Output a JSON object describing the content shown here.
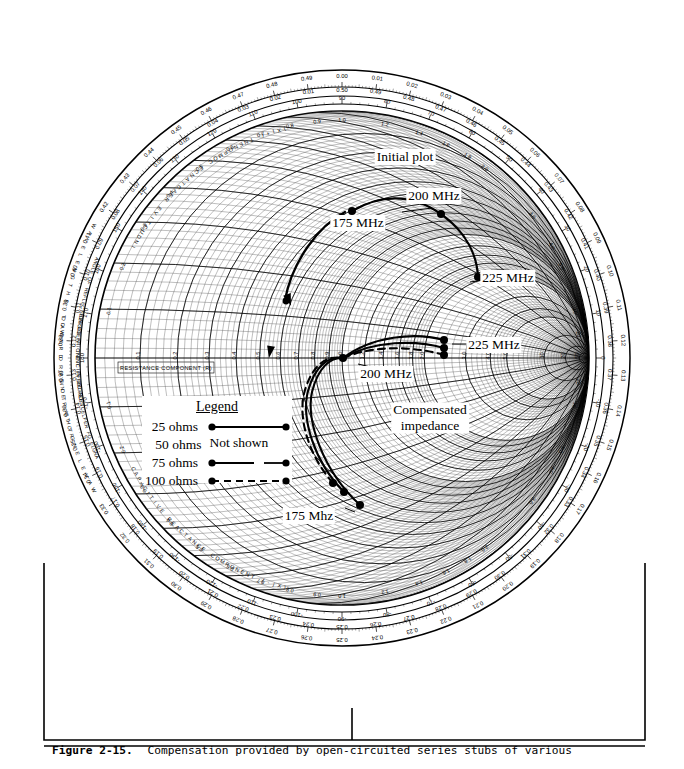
{
  "figure": {
    "caption_label": "Figure 2-15.",
    "caption_text": "Compensation provided by open-circuited series stubs of various"
  },
  "chart_data": {
    "type": "scatter",
    "chart_name": "Smith Chart (normalized impedance coordinates)",
    "xlabel": "RESISTANCE COMPONENT (R)",
    "axis_labels": {
      "resistance": "RESISTANCE COMPONENT (R)",
      "inductive": "INDUCTIVE REACTANCE COMPONENT (+jX)",
      "capacitive": "CAPACITIVE REACTANCE COMPONENT (-jX)",
      "angle_upper": "ANGLE OF REFLECTION COEFFICIENT IN DEGREES",
      "angle_lower": "ANGLE OF REFLECTION COEFFICIENT IN DEGREES",
      "toward_generator": "WAVELENGTHS TOWARD GENERATOR",
      "toward_load": "WAVELENGTHS TOWARD LOAD"
    },
    "grid": true,
    "legend_position": "left-center",
    "outer_scales": {
      "wavelengths_toward_generator": [
        "0.00",
        "0.01",
        "0.02",
        "0.03",
        "0.04",
        "0.05",
        "0.06",
        "0.07",
        "0.08",
        "0.09",
        "0.10",
        "0.11",
        "0.12",
        "0.13",
        "0.14",
        "0.15",
        "0.16",
        "0.17",
        "0.18",
        "0.19",
        "0.20",
        "0.21",
        "0.22",
        "0.23",
        "0.24",
        "0.25",
        "0.26",
        "0.27",
        "0.28",
        "0.29",
        "0.30",
        "0.31",
        "0.32",
        "0.33",
        "0.34",
        "0.35",
        "0.36",
        "0.37",
        "0.38",
        "0.39",
        "0.40",
        "0.41",
        "0.42",
        "0.43",
        "0.44",
        "0.45",
        "0.46",
        "0.47",
        "0.48",
        "0.49"
      ],
      "wavelengths_toward_load": [
        "0.50",
        "0.49",
        "0.48",
        "0.47",
        "0.46",
        "0.45",
        "0.44",
        "0.43",
        "0.42",
        "0.41",
        "0.40",
        "0.39",
        "0.38",
        "0.37",
        "0.36",
        "0.35",
        "0.34",
        "0.33",
        "0.32",
        "0.31",
        "0.30",
        "0.29",
        "0.28",
        "0.27",
        "0.26",
        "0.25",
        "0.24",
        "0.23",
        "0.22",
        "0.21",
        "0.20",
        "0.19",
        "0.18",
        "0.17",
        "0.16",
        "0.15",
        "0.14",
        "0.13",
        "0.12",
        "0.11",
        "0.10",
        "0.09",
        "0.08",
        "0.07",
        "0.06",
        "0.05",
        "0.04",
        "0.03",
        "0.02",
        "0.01"
      ],
      "angle_degrees": [
        "0",
        "10",
        "20",
        "30",
        "40",
        "50",
        "60",
        "70",
        "80",
        "90",
        "100",
        "110",
        "120",
        "130",
        "140",
        "150",
        "160",
        "170",
        "180",
        "-170",
        "-160",
        "-150",
        "-140",
        "-130",
        "-120",
        "-110",
        "-100",
        "-90",
        "-80",
        "-70",
        "-60",
        "-50",
        "-40",
        "-30",
        "-20",
        "-10"
      ]
    },
    "resistance_ticks": [
      "0.1",
      "0.2",
      "0.3",
      "0.4",
      "0.5",
      "0.6",
      "0.7",
      "0.8",
      "0.9",
      "1.0",
      "1.2",
      "1.4",
      "1.6",
      "1.8",
      "2.0",
      "3.0",
      "4.0",
      "5.0",
      "10",
      "20",
      "50"
    ],
    "reactance_ticks": [
      "0.1",
      "0.2",
      "0.3",
      "0.4",
      "0.5",
      "0.6",
      "0.7",
      "0.8",
      "0.9",
      "1.0",
      "1.2",
      "1.4",
      "1.6",
      "1.8",
      "2.0",
      "3.0",
      "4.0",
      "5.0",
      "10",
      "20",
      "50"
    ],
    "annotations": [
      {
        "id": "initial-plot",
        "text": "Initial plot",
        "x": 405,
        "y": 157
      },
      {
        "id": "initial-175",
        "text": "175 MHz",
        "x": 358,
        "y": 223
      },
      {
        "id": "initial-200",
        "text": "200 MHz",
        "x": 434,
        "y": 196
      },
      {
        "id": "initial-225",
        "text": "225 MHz",
        "x": 508,
        "y": 278
      },
      {
        "id": "comp-225",
        "text": "225 MHz",
        "x": 494,
        "y": 345
      },
      {
        "id": "comp-200",
        "text": "200 MHz",
        "x": 386,
        "y": 374
      },
      {
        "id": "comp-label",
        "text": "Compensated\nimpedance",
        "x": 430,
        "y": 418
      },
      {
        "id": "comp-175",
        "text": "175 Mhz",
        "x": 309,
        "y": 516
      }
    ],
    "series": [
      {
        "name": "Initial plot (uncompensated)",
        "style": "solid",
        "points": [
          {
            "label": "175 MHz",
            "x": 352,
            "y": 211
          },
          {
            "label": "200 MHz",
            "x": 441,
            "y": 214
          },
          {
            "label": "225 MHz",
            "x": 478,
            "y": 277
          }
        ]
      },
      {
        "name": "25 ohms compensated",
        "style": "solid",
        "points": [
          {
            "label": "175 Mhz",
            "x": 360,
            "y": 505
          },
          {
            "label": "200 MHz",
            "x": 343,
            "y": 358
          },
          {
            "label": "225 MHz",
            "x": 444,
            "y": 340
          }
        ]
      },
      {
        "name": "75 ohms compensated",
        "style": "solid-gap",
        "points": [
          {
            "label": "175 Mhz",
            "x": 344,
            "y": 492
          },
          {
            "label": "200 MHz",
            "x": 343,
            "y": 358
          },
          {
            "label": "225 MHz",
            "x": 444,
            "y": 348
          }
        ]
      },
      {
        "name": "100 ohms compensated",
        "style": "dashed",
        "points": [
          {
            "label": "175 Mhz",
            "x": 333,
            "y": 483
          },
          {
            "label": "200 MHz",
            "x": 343,
            "y": 358
          },
          {
            "label": "225 MHz",
            "x": 444,
            "y": 355
          }
        ]
      }
    ]
  },
  "legend": {
    "title": "Legend",
    "rows": [
      {
        "label": "25  ohms",
        "style": "solid",
        "note": ""
      },
      {
        "label": "50  ohms",
        "style": "none",
        "note": "Not shown"
      },
      {
        "label": "75  ohms",
        "style": "solid-gap",
        "note": ""
      },
      {
        "label": "100  ohms",
        "style": "dashed",
        "note": ""
      }
    ]
  },
  "colors": {
    "ink": "#000000",
    "paper": "#ffffff",
    "grid": "#1a1a1a",
    "grid_light": "#555555"
  }
}
